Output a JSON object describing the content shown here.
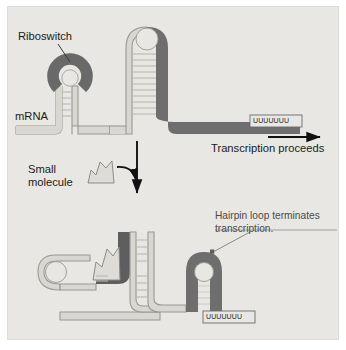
{
  "figure": {
    "background_color": "#e9e7e3",
    "colors": {
      "strand_light": "#d9d7d2",
      "strand_light_stroke": "#9a9893",
      "strand_dark": "#6e6e6e",
      "riboswitch_dark": "#5e5e5e",
      "rung": "#b8b6b1",
      "arrow": "#111111",
      "text": "#1a1a1a",
      "annotation_text": "#4a4a4a"
    }
  },
  "labels": {
    "riboswitch": "Riboswitch",
    "mrna": "mRNA",
    "small_molecule": "Small molecule",
    "transcription_proceeds": "Transcription proceeds",
    "hairpin_annotation": "Hairpin loop terminates transcription.",
    "terminator_sequence_top": "UUUUUUU",
    "terminator_sequence_bottom": "UUUUUUU"
  },
  "panels": {
    "top": {
      "description": "mRNA with unbound riboswitch; antiterminator hairpin forms and transcription continues past the poly-U tract.",
      "elements": [
        "mRNA backbone",
        "riboswitch aptamer ring",
        "antiterminator hairpin",
        "poly-U terminator box",
        "transcription direction arrow"
      ]
    },
    "bottom": {
      "description": "Small molecule bound to riboswitch; terminator hairpin loop forms and transcription stops at the poly-U tract.",
      "elements": [
        "mRNA backbone",
        "ligand-bound riboswitch",
        "small molecule ligand",
        "terminator hairpin loop",
        "poly-U terminator box"
      ]
    }
  },
  "arrows": {
    "transcription_direction": "right",
    "process_flow": "down",
    "ligand_binding": "curved-down-right"
  }
}
